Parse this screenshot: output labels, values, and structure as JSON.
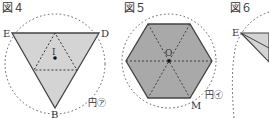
{
  "figures": [
    {
      "title": "図４",
      "labels": {
        "E": "E",
        "D": "D",
        "B": "B",
        "I": "I",
        "circle": "円㋐"
      }
    },
    {
      "title": "図５",
      "labels": {
        "O": "O",
        "M": "M",
        "circle": "円㋑"
      }
    },
    {
      "title": "図６",
      "labels": {
        "E": "E"
      }
    }
  ],
  "colors": {
    "fill4": "#d4d4d4",
    "fill5": "#a9a9a9",
    "stroke": "#444444",
    "dotted": "#555555"
  }
}
